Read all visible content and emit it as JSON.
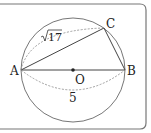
{
  "diagram": {
    "type": "circle-geometry",
    "points": {
      "A": {
        "label": "A",
        "x": 21,
        "y": 70
      },
      "B": {
        "label": "B",
        "x": 125,
        "y": 70
      },
      "C": {
        "label": "C",
        "x": 104,
        "y": 28
      },
      "O": {
        "label": "O",
        "x": 73,
        "y": 70
      }
    },
    "segments": [
      {
        "from": "A",
        "to": "B",
        "style": "solid"
      },
      {
        "from": "A",
        "to": "C",
        "style": "solid"
      },
      {
        "from": "C",
        "to": "B",
        "style": "solid"
      }
    ],
    "measurements": {
      "AC": {
        "label": "√17",
        "radicand": "17",
        "style": "dashed-arc"
      },
      "AB": {
        "label": "5",
        "style": "dashed-arc"
      }
    },
    "circle": {
      "center": "O",
      "radius": 52
    },
    "colors": {
      "stroke": "#555555",
      "dash": "#888888",
      "frame": "#777777"
    }
  }
}
